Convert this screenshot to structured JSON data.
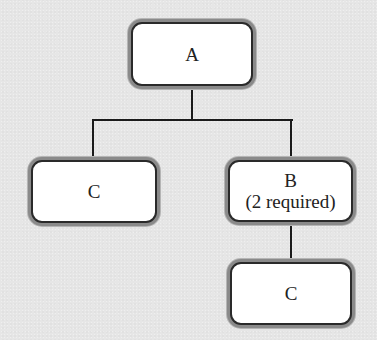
{
  "diagram": {
    "type": "tree",
    "nodes": [
      {
        "id": "A",
        "label": "A",
        "sub": ""
      },
      {
        "id": "C_left",
        "label": "C",
        "sub": ""
      },
      {
        "id": "B",
        "label": "B",
        "sub": "(2 required)"
      },
      {
        "id": "C_bottom",
        "label": "C",
        "sub": ""
      }
    ],
    "edges": [
      {
        "from": "A",
        "to": "C_left"
      },
      {
        "from": "A",
        "to": "B"
      },
      {
        "from": "B",
        "to": "C_bottom"
      }
    ],
    "colors": {
      "background": "#e6e6e6",
      "node_fill": "#ffffff",
      "node_border": "#2a2a2a",
      "node_halo": "#8a8a8a",
      "connector": "#1a1a1a"
    }
  }
}
